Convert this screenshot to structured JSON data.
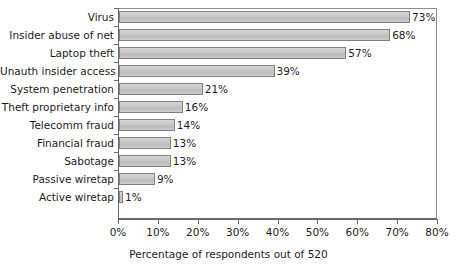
{
  "chart_data": {
    "type": "bar",
    "orientation": "horizontal",
    "title": "",
    "xlabel": "Percentage of respondents out of 520",
    "ylabel": "",
    "xlim": [
      0,
      80
    ],
    "grid": false,
    "legend": null,
    "categories": [
      "Virus",
      "Insider abuse of net",
      "Laptop theft",
      "Unauth insider access",
      "System penetration",
      "Theft proprietary info",
      "Telecomm fraud",
      "Financial fraud",
      "Sabotage",
      "Passive wiretap",
      "Active wiretap"
    ],
    "values": [
      73,
      68,
      57,
      39,
      21,
      16,
      14,
      13,
      13,
      9,
      1
    ],
    "value_labels": [
      "73%",
      "68%",
      "57%",
      "39%",
      "21%",
      "16%",
      "14%",
      "13%",
      "13%",
      "9%",
      "1%"
    ],
    "xticks": [
      0,
      10,
      20,
      30,
      40,
      50,
      60,
      70,
      80
    ],
    "xtick_labels": [
      "0%",
      "10%",
      "20%",
      "30%",
      "40%",
      "50%",
      "60%",
      "70%",
      "80%"
    ],
    "bar_fill_color": "#c9c9c9",
    "bar_border_color": "#808080",
    "axis_color": "#6a6a6a",
    "text_color": "#1c1c1c"
  }
}
